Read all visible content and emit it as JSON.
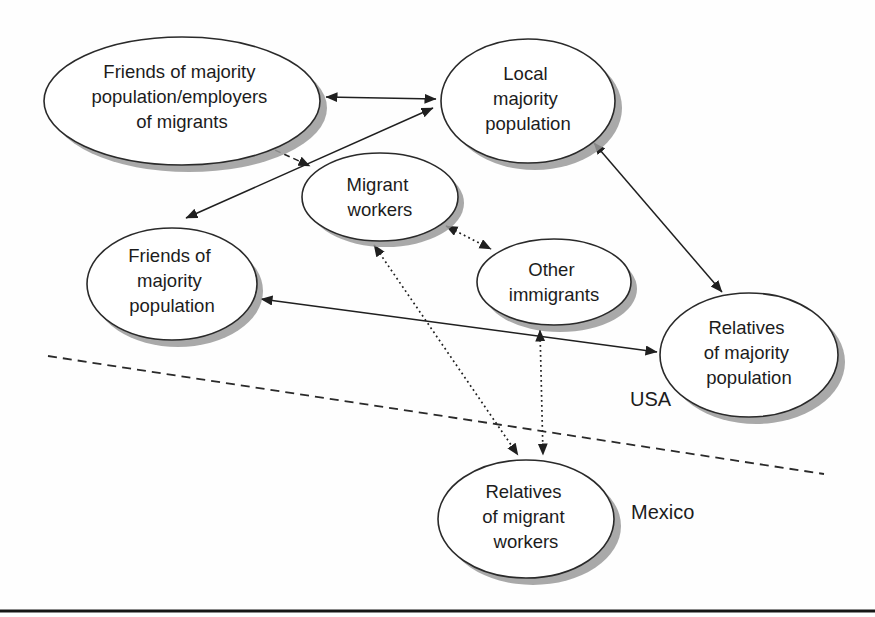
{
  "diagram": {
    "nodes": {
      "employers": {
        "lines": [
          "Friends of majority",
          "population/employers",
          "of migrants"
        ],
        "text": "Friends of majority population/employers of migrants"
      },
      "local_majority": {
        "lines": [
          "Local",
          "majority",
          "population"
        ],
        "text": "Local majority population"
      },
      "migrant_workers": {
        "lines": [
          "Migrant",
          "workers"
        ],
        "text": "Migrant workers"
      },
      "friends_majority": {
        "lines": [
          "Friends of",
          "majority",
          "population"
        ],
        "text": "Friends of majority population"
      },
      "other_immigrants": {
        "lines": [
          "Other",
          "immigrants"
        ],
        "text": "Other immigrants"
      },
      "relatives_majority": {
        "lines": [
          "Relatives",
          "of majority",
          "population"
        ],
        "text": "Relatives of majority population"
      },
      "relatives_migrant": {
        "lines": [
          "Relatives",
          "of migrant",
          "workers"
        ],
        "text": "Relatives of migrant workers"
      }
    },
    "edges": [
      {
        "from": "employers",
        "to": "local_majority",
        "style": "solid",
        "arrows": "both"
      },
      {
        "from": "local_majority",
        "to": "friends_majority",
        "style": "solid",
        "arrows": "both"
      },
      {
        "from": "employers",
        "to": "migrant_workers",
        "style": "dashed",
        "arrows": "to"
      },
      {
        "from": "local_majority",
        "to": "relatives_majority",
        "style": "solid",
        "arrows": "both"
      },
      {
        "from": "friends_majority",
        "to": "relatives_majority",
        "style": "solid",
        "arrows": "both"
      },
      {
        "from": "migrant_workers",
        "to": "other_immigrants",
        "style": "dotted",
        "arrows": "both"
      },
      {
        "from": "migrant_workers",
        "to": "relatives_migrant",
        "style": "dotted",
        "arrows": "both"
      },
      {
        "from": "other_immigrants",
        "to": "relatives_migrant",
        "style": "dotted",
        "arrows": "both"
      }
    ],
    "border": {
      "style": "dashed",
      "label_above": "USA",
      "label_below": "Mexico"
    },
    "labels": {
      "usa": "USA",
      "mexico": "Mexico"
    },
    "colors": {
      "line": "#1f1f1f",
      "ellipse_fill": "#ffffff",
      "shadow": "#9a9a9a",
      "text": "#1c1c1c",
      "background": "#fefefe"
    }
  }
}
